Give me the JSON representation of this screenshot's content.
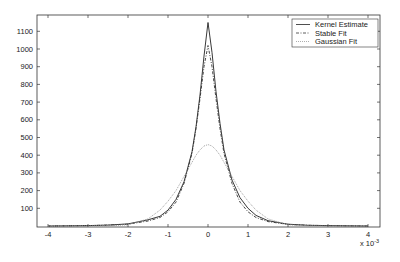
{
  "chart_data": {
    "type": "line",
    "title": "",
    "xlabel": "",
    "ylabel": "",
    "x_multiplier_label": "x 10",
    "x_multiplier_exp": "-3",
    "xlim": [
      -4.2,
      4.3
    ],
    "ylim": [
      0,
      1190
    ],
    "x_ticks": [
      -4,
      -3,
      -2,
      -1,
      0,
      1,
      2,
      3,
      4
    ],
    "y_ticks": [
      100,
      200,
      300,
      400,
      500,
      600,
      700,
      800,
      900,
      1000,
      1100
    ],
    "grid": false,
    "legend_position": "upper right",
    "x": [
      -4,
      -3,
      -2.5,
      -2,
      -1.5,
      -1.2,
      -1,
      -0.8,
      -0.6,
      -0.4,
      -0.3,
      -0.2,
      -0.1,
      0,
      0.1,
      0.2,
      0.3,
      0.4,
      0.6,
      0.8,
      1,
      1.2,
      1.5,
      2,
      2.5,
      3,
      4
    ],
    "series": [
      {
        "name": "Kernel Estimate",
        "style": "solid",
        "color": "#222222",
        "values": [
          0,
          2,
          5,
          12,
          35,
          55,
          90,
          150,
          250,
          420,
          560,
          740,
          960,
          1150,
          980,
          760,
          580,
          430,
          260,
          160,
          100,
          60,
          30,
          10,
          4,
          2,
          0
        ]
      },
      {
        "name": "Stable Fit",
        "style": "dashdot",
        "color": "#333333",
        "values": [
          0,
          2,
          5,
          10,
          28,
          48,
          80,
          135,
          240,
          410,
          550,
          720,
          900,
          1020,
          900,
          720,
          550,
          410,
          240,
          135,
          80,
          48,
          25,
          9,
          4,
          2,
          0
        ]
      },
      {
        "name": "Gaussian Fit",
        "style": "dotted",
        "color": "#999999",
        "values": [
          0,
          0,
          1,
          7,
          40,
          90,
          140,
          200,
          280,
          360,
          400,
          430,
          452,
          460,
          452,
          430,
          400,
          360,
          280,
          200,
          140,
          90,
          40,
          7,
          1,
          0,
          0
        ]
      }
    ]
  },
  "legend": {
    "items": [
      {
        "label": "Kernel Estimate"
      },
      {
        "label": "Stable Fit"
      },
      {
        "label": "Gaussian Fit"
      }
    ]
  }
}
